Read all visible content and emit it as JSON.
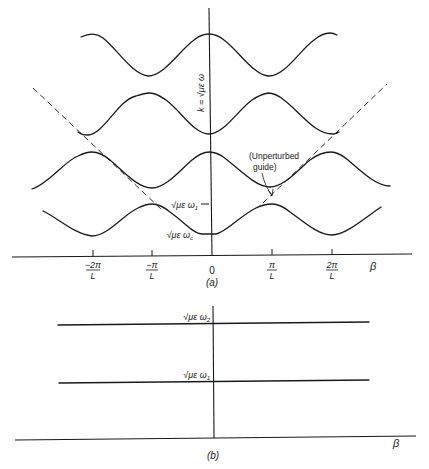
{
  "figure": {
    "panel_a": {
      "caption": "(a)",
      "y_axis_label": "k = √με ω",
      "x_axis_label": "β",
      "x_ticks": [
        {
          "num": "−2π",
          "den": "L",
          "x": 93
        },
        {
          "num": "−π",
          "den": "L",
          "x": 152
        },
        {
          "num": "0",
          "den": "",
          "x": 212
        },
        {
          "num": "π",
          "den": "L",
          "x": 272
        },
        {
          "num": "2π",
          "den": "L",
          "x": 332
        }
      ],
      "y_markers": [
        {
          "label": "√με ω",
          "sub": "1",
          "y": 204
        },
        {
          "label": "√με ω",
          "sub": "c",
          "y": 234
        }
      ],
      "annotation": {
        "line1": "(Unperturbed",
        "line2": "guide)"
      },
      "bands": [
        {
          "name": "band-4-top",
          "description": "periodic band, max at β=0"
        },
        {
          "name": "band-3",
          "description": "periodic band, min at β=0"
        },
        {
          "name": "band-2",
          "description": "periodic band, max at β=0"
        },
        {
          "name": "band-1-lowest",
          "description": "periodic band, min at β=0 (ωc)"
        }
      ],
      "light_lines": "dashed lines k = ±β (unperturbed guide)"
    },
    "panel_b": {
      "caption": "(b)",
      "x_axis_label": "β",
      "levels": [
        {
          "label": "√με ω",
          "sub": "2",
          "y": 324
        },
        {
          "label": "√με ω",
          "sub": "1",
          "y": 382
        }
      ]
    }
  }
}
